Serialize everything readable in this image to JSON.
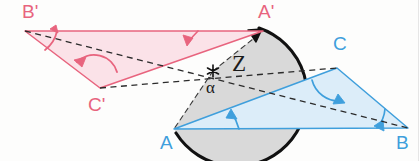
{
  "figure": {
    "background_color": "#fdfdfc",
    "colors": {
      "pink_stroke": "#e8647e",
      "pink_fill": "#fbe2e8",
      "blue_stroke": "#3f9fdc",
      "blue_fill": "#dcedf9",
      "gray_fill": "#d6d6d6",
      "gray_stroke": "#9a9a9a",
      "dashed_stroke": "#2b2b2b",
      "arc_stroke": "#111111"
    }
  },
  "labels": {
    "b_prime": "B'",
    "a_prime": "A'",
    "c_prime": "C'",
    "c": "C",
    "a": "A",
    "b": "B",
    "center": "Z",
    "angle": "α"
  },
  "geometry": {
    "center_z": {
      "x": 213,
      "y": 71
    },
    "original_triangle": {
      "name": "ABC",
      "vertices": [
        {
          "label": "A",
          "x": 174,
          "y": 129
        },
        {
          "label": "B",
          "x": 408,
          "y": 128
        },
        {
          "label": "C",
          "x": 337,
          "y": 68
        }
      ]
    },
    "image_triangle": {
      "name": "A'B'C'",
      "vertices": [
        {
          "label": "A'",
          "x": 263,
          "y": 31
        },
        {
          "label": "B'",
          "x": 25,
          "y": 31
        },
        {
          "label": "C'",
          "x": 100,
          "y": 88
        }
      ]
    },
    "rotation_sector": {
      "from_vertex": "A",
      "to_vertex": "A'",
      "center": "Z",
      "direction": "counterclockwise"
    }
  },
  "label_positions": {
    "b_prime": {
      "x": 22,
      "y": 2
    },
    "a_prime": {
      "x": 258,
      "y": 2
    },
    "c_prime": {
      "x": 88,
      "y": 95
    },
    "c": {
      "x": 333,
      "y": 34
    },
    "a": {
      "x": 160,
      "y": 133
    },
    "b": {
      "x": 396,
      "y": 133
    },
    "center": {
      "x": 232,
      "y": 54
    },
    "angle": {
      "x": 206,
      "y": 80
    }
  }
}
